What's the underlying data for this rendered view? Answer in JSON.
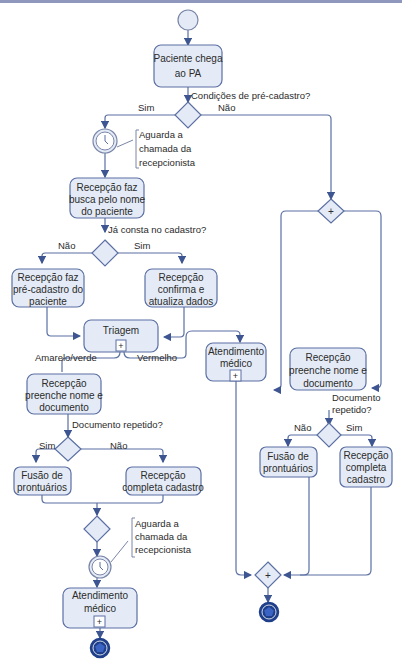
{
  "start_event": {
    "label": ""
  },
  "tasks": {
    "paciente_chega": [
      "Paciente chega",
      "ao PA"
    ],
    "busca_nome": [
      "Recepção faz",
      "busca pelo nome",
      "do paciente"
    ],
    "pre_cadastro": [
      "Recepção faz",
      "pré-cadastro do",
      "paciente"
    ],
    "confirma": [
      "Recepção",
      "confirma e",
      "atualiza dados"
    ],
    "triagem": [
      "Triagem"
    ],
    "preenche_left": [
      "Recepção",
      "preenche nome e",
      "documento"
    ],
    "fusao_left": [
      "Fusão de",
      "prontuários"
    ],
    "completa_left": [
      "Recepção",
      "completa cadastro"
    ],
    "atendimento_left": [
      "Atendimento",
      "médico"
    ],
    "atendimento_mid": [
      "Atendimento",
      "médico"
    ],
    "preenche_right": [
      "Recepção",
      "preenche nome e",
      "documento"
    ],
    "fusao_right": [
      "Fusão de",
      "prontuários"
    ],
    "completa_right": [
      "Recepção",
      "completa",
      "cadastro"
    ]
  },
  "questions": {
    "condicoes": "Condições de pré-cadastro?",
    "ja_consta": "Já consta no cadastro?",
    "doc_repetido_left": "Documento repetido?",
    "doc_repetido_right": [
      "Documento",
      "repetido?"
    ]
  },
  "branches": {
    "sim": "Sim",
    "nao": "Não",
    "amarelo_verde": "Amarelo/verde",
    "vermelho": "Vermelho"
  },
  "annotations": {
    "aguarda_1": [
      "Aguarda a",
      "chamada da",
      "recepcionista"
    ],
    "aguarda_2": [
      "Aguarda a",
      "chamada da",
      "recepcionista"
    ]
  },
  "icons": {
    "timer": "clock-icon",
    "parallel_gateway": "plus-icon",
    "subprocess": "plus-icon",
    "end": "pentagon-icon"
  },
  "colors": {
    "task_fill": "#e4ebf7",
    "stroke": "#5b6fa3",
    "end_fill": "#1f3f8a",
    "topbar": "#8f97bd"
  }
}
